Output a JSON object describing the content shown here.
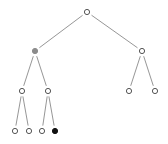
{
  "diagram": {
    "type": "binary-tree",
    "colors": {
      "edge": "#8a8a8a",
      "node_stroke": "#555555",
      "node_empty_fill": "#ffffff",
      "node_highlight_gray": "#8c8c8c",
      "node_highlight_black": "#111111"
    },
    "nodes": [
      {
        "id": "root",
        "x": 87,
        "y": 12,
        "state": "empty"
      },
      {
        "id": "L",
        "x": 35,
        "y": 51,
        "state": "gray"
      },
      {
        "id": "R",
        "x": 142,
        "y": 51,
        "state": "empty"
      },
      {
        "id": "LL",
        "x": 22,
        "y": 91,
        "state": "empty"
      },
      {
        "id": "LR",
        "x": 48,
        "y": 91,
        "state": "empty"
      },
      {
        "id": "RL",
        "x": 129,
        "y": 91,
        "state": "empty"
      },
      {
        "id": "RR",
        "x": 155,
        "y": 91,
        "state": "empty"
      },
      {
        "id": "LLL",
        "x": 15,
        "y": 131,
        "state": "empty"
      },
      {
        "id": "LLR",
        "x": 29,
        "y": 131,
        "state": "empty"
      },
      {
        "id": "LRL",
        "x": 42,
        "y": 131,
        "state": "empty"
      },
      {
        "id": "LRR",
        "x": 55,
        "y": 131,
        "state": "black"
      }
    ],
    "edges": [
      [
        "root",
        "L"
      ],
      [
        "root",
        "R"
      ],
      [
        "L",
        "LL"
      ],
      [
        "L",
        "LR"
      ],
      [
        "R",
        "RL"
      ],
      [
        "R",
        "RR"
      ],
      [
        "LL",
        "LLL"
      ],
      [
        "LL",
        "LLR"
      ],
      [
        "LR",
        "LRL"
      ],
      [
        "LR",
        "LRR"
      ]
    ]
  }
}
